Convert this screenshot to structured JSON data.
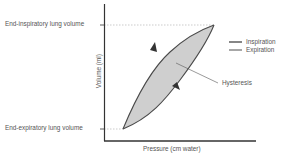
{
  "diagram": {
    "type": "pressure-volume hysteresis loop",
    "y_axis_label": "Volume (ml)",
    "x_axis_label": "Pressure (cm water)",
    "y_tick_labels": {
      "top": "End-inspiratory lung volume",
      "bottom": "End-expiratory lung volume"
    },
    "annotation": "Hysteresis",
    "legend": [
      {
        "label": "Inspiration",
        "color": "#555555"
      },
      {
        "label": "Expiration",
        "color": "#555555"
      }
    ],
    "colors": {
      "loop_fill": "#cfcfcf",
      "curve_stroke": "#4a4a4a",
      "axis": "#333333",
      "text": "#555555",
      "dashed_guides": "#aaaaaa"
    }
  }
}
